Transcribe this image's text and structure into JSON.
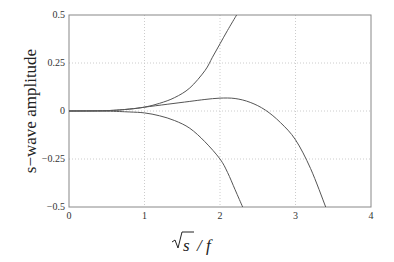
{
  "chart_data": {
    "type": "line",
    "title": "",
    "xlabel": "√s / f",
    "ylabel": "s−wave amplitude",
    "xlim": [
      0,
      4
    ],
    "ylim": [
      -0.5,
      0.5
    ],
    "xticks": [
      "0",
      "1",
      "2",
      "3",
      "4"
    ],
    "yticks": [
      "0.5",
      "0.25",
      "0",
      "−0.25",
      "−0.5"
    ],
    "grid": true,
    "legend": null,
    "series": [
      {
        "name": "upper",
        "x": [
          0,
          0.5,
          0.8,
          1.0,
          1.2,
          1.4,
          1.6,
          1.8,
          1.9,
          2.0,
          2.1,
          2.22
        ],
        "y": [
          0,
          0.002,
          0.01,
          0.02,
          0.04,
          0.07,
          0.12,
          0.21,
          0.28,
          0.35,
          0.42,
          0.5
        ]
      },
      {
        "name": "middle",
        "x": [
          0,
          0.5,
          0.8,
          1.0,
          1.3,
          1.6,
          1.8,
          2.0,
          2.2,
          2.4,
          2.6,
          2.8,
          3.0,
          3.2,
          3.4
        ],
        "y": [
          0,
          0.002,
          0.01,
          0.02,
          0.035,
          0.05,
          0.06,
          0.067,
          0.065,
          0.045,
          0.005,
          -0.06,
          -0.15,
          -0.3,
          -0.5
        ]
      },
      {
        "name": "lower",
        "x": [
          0,
          0.5,
          0.8,
          1.0,
          1.2,
          1.4,
          1.6,
          1.8,
          2.0,
          2.1,
          2.2,
          2.3
        ],
        "y": [
          0,
          -0.001,
          -0.005,
          -0.01,
          -0.025,
          -0.05,
          -0.09,
          -0.16,
          -0.25,
          -0.32,
          -0.41,
          -0.5
        ]
      }
    ]
  },
  "colors": {
    "line": "#555555",
    "grid": "#cccccc",
    "axis": "#888888"
  }
}
